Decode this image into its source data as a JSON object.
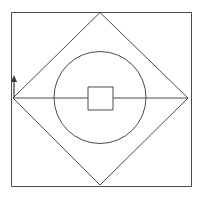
{
  "figure": {
    "title": "Geometric line drawing",
    "background_color": "#ffffff",
    "stroke_color": "#4a4a4a",
    "stroke_width": 1,
    "canvas": {
      "width": 201,
      "height": 201
    },
    "shapes": [
      {
        "name": "outer-square",
        "type": "rect",
        "x": 11,
        "y": 12,
        "width": 181,
        "height": 175,
        "label": "Outer square"
      },
      {
        "name": "inscribed-diamond",
        "type": "polygon",
        "points": "100,12 188,98 100,185 13,98",
        "label": "Inscribed diamond"
      },
      {
        "name": "inner-circle",
        "type": "circle",
        "cx": 100,
        "cy": 97.5,
        "r": 46,
        "label": "Inner circle"
      },
      {
        "name": "horizontal-line-left",
        "type": "line",
        "x1": 13,
        "y1": 98,
        "x2": 88,
        "y2": 98,
        "label": "Left horizontal segment"
      },
      {
        "name": "horizontal-line-right",
        "type": "line",
        "x1": 112,
        "y1": 98,
        "x2": 188,
        "y2": 98,
        "label": "Right horizontal segment"
      },
      {
        "name": "center-zigzag",
        "type": "polyline",
        "points": "88,98 88,110 113,110 113,98 113,87 88,87 88,98",
        "label": "Central S-shaped zigzag"
      },
      {
        "name": "upper-center-rect",
        "type": "rect",
        "x": 88,
        "y": 87,
        "width": 25,
        "height": 11,
        "label": "Upper center rectangle"
      },
      {
        "name": "lower-center-rect",
        "type": "rect",
        "x": 88,
        "y": 98,
        "width": 25,
        "height": 12,
        "label": "Lower center rectangle"
      },
      {
        "name": "up-arrow-marker",
        "type": "arrow",
        "x1": 14,
        "y1": 97,
        "x2": 14,
        "y2": 76,
        "direction": "up",
        "label": "Upward arrow at left vertex"
      }
    ],
    "vertices": {
      "square_top_left": [
        11,
        12
      ],
      "square_top_right": [
        192,
        12
      ],
      "square_bottom_right": [
        192,
        187
      ],
      "square_bottom_left": [
        11,
        187
      ],
      "diamond_top": [
        100,
        12
      ],
      "diamond_right": [
        188,
        98
      ],
      "diamond_bottom": [
        100,
        185
      ],
      "diamond_left": [
        13,
        98
      ]
    }
  }
}
